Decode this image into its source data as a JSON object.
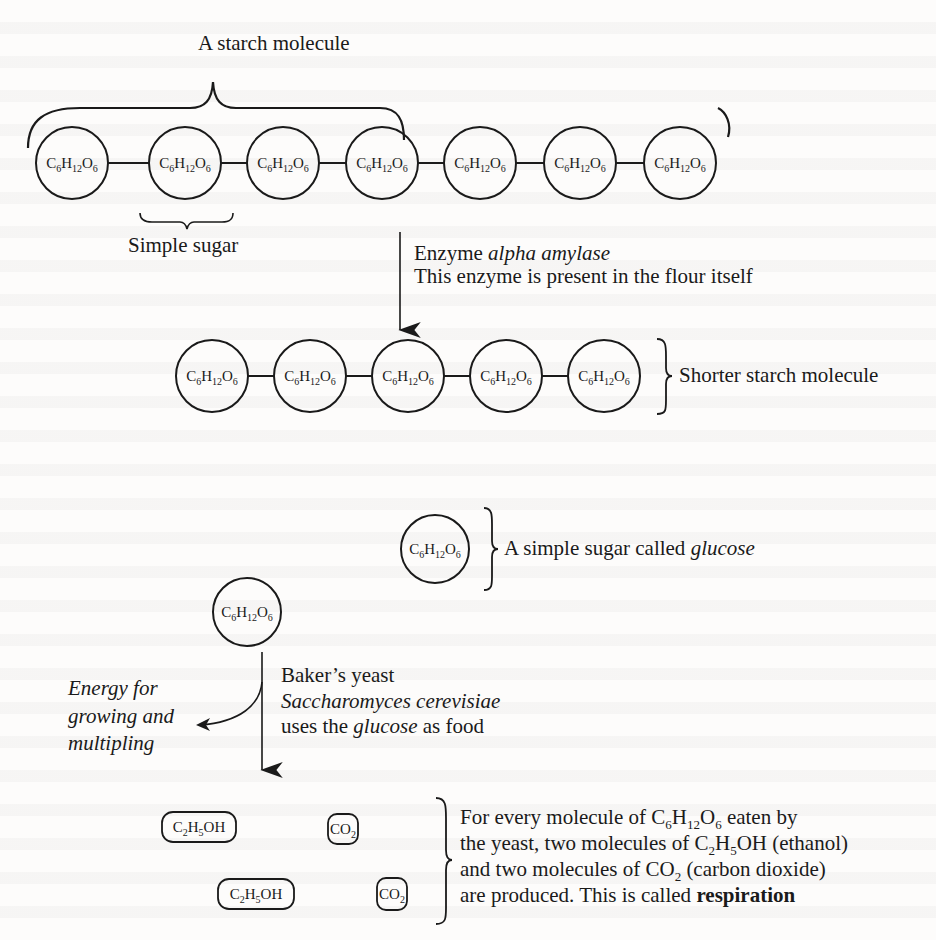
{
  "diagram": {
    "title": "A starch molecule",
    "molecule_formula": "C6H12O6",
    "starch_chain": {
      "units": [
        "C6H12O6",
        "C6H12O6",
        "C6H12O6",
        "C6H12O6",
        "C6H12O6",
        "C6H12O6",
        "C6H12O6"
      ],
      "subunit_label": "Simple sugar"
    },
    "enzyme_step": {
      "line1_prefix": "Enzyme ",
      "line1_italic": "alpha amylase",
      "line2": "This enzyme is present in the flour itself"
    },
    "shorter_chain": {
      "units": [
        "C6H12O6",
        "C6H12O6",
        "C6H12O6",
        "C6H12O6",
        "C6H12O6"
      ],
      "label": "Shorter starch molecule"
    },
    "glucose": {
      "label_prefix": "A simple sugar called ",
      "label_italic": "glucose"
    },
    "yeast_step": {
      "line1": "Baker’s yeast",
      "line2_italic": "Saccharomyces cerevisiae",
      "line3_prefix": "uses the ",
      "line3_italic": "glucose",
      "line3_suffix": " as food"
    },
    "energy_branch": {
      "line1": "Energy for",
      "line2": "growing and",
      "line3": "multipling"
    },
    "products": {
      "items": [
        "C2H5OH",
        "CO2",
        "C2H5OH",
        "CO2"
      ],
      "description": {
        "line1": "For every molecule of C6H12O6 eaten by",
        "line2": "the yeast, two molecules of C2H5OH (ethanol)",
        "line3": "and two molecules of CO2 (carbon dioxide)",
        "line4_prefix": "are produced. This is called ",
        "line4_bold": "respiration"
      }
    }
  }
}
